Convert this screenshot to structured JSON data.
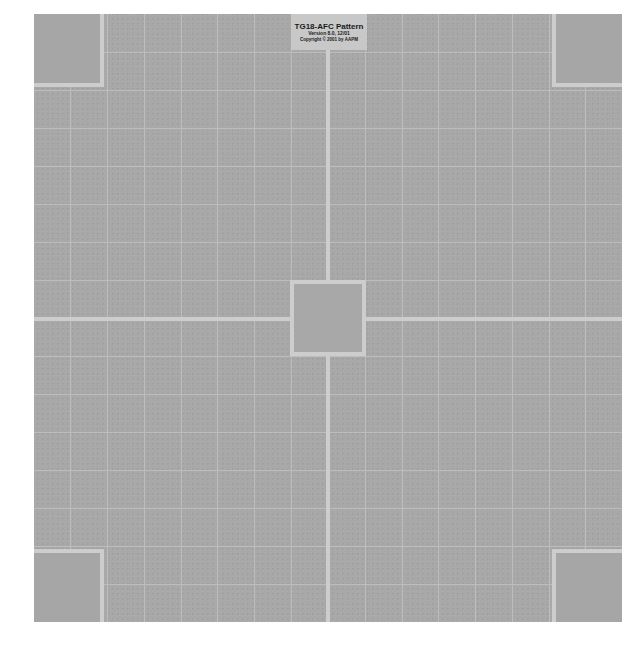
{
  "pattern": {
    "name": "TG18-AFC Pattern",
    "label": {
      "title": "TG18-AFC Pattern",
      "version": "Version 8.0, 12/01",
      "copyright": "Copyright © 2001 by AAPM"
    },
    "grid": {
      "columns": 16,
      "rows": 16
    },
    "colors": {
      "background": "#a8a8a8",
      "grid_line": "#bdbdbd",
      "cross_line": "#cdcdcd",
      "label_background": "#c8c8c8",
      "page": "#ffffff"
    },
    "regions": [
      "corner-top-left",
      "corner-top-right",
      "corner-bottom-left",
      "corner-bottom-right",
      "center-square",
      "label-box"
    ]
  }
}
